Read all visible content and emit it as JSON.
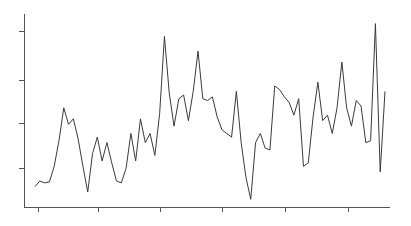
{
  "chart_data": {
    "type": "line",
    "title": "",
    "subtitle": "",
    "xlabel": "",
    "ylabel": "",
    "grid": false,
    "legend": false,
    "legend_position": "none",
    "line_color": "#3a3a3a",
    "axis_color": "#555555",
    "background_color": "#ffffff",
    "xlim": [
      0,
      80
    ],
    "ylim": [
      0,
      100
    ],
    "xticks": [
      4,
      17,
      30,
      44,
      57,
      70
    ],
    "xticklabels": [
      "",
      "",
      "",
      "",
      "",
      ""
    ],
    "yticks": [
      20,
      40,
      60,
      80
    ],
    "yticklabels": [
      "",
      "",
      "",
      ""
    ],
    "x": [
      0,
      1,
      2,
      3,
      4,
      5,
      6,
      7,
      8,
      9,
      10,
      11,
      12,
      13,
      14,
      15,
      16,
      17,
      18,
      19,
      20,
      21,
      22,
      23,
      24,
      25,
      26,
      27,
      28,
      29,
      30,
      31,
      32,
      33,
      34,
      35,
      36,
      37,
      38,
      39,
      40,
      41,
      42,
      43,
      44,
      45,
      46,
      47,
      48,
      49,
      50,
      51,
      52,
      53,
      54,
      55,
      56,
      57,
      58,
      59,
      60,
      61,
      62,
      63,
      64,
      65,
      66,
      67,
      68,
      69,
      70,
      71,
      72,
      73
    ],
    "values": [
      9,
      12,
      11,
      11.5,
      20,
      34,
      52,
      43,
      46,
      35,
      20,
      6,
      27,
      36,
      23,
      33,
      22,
      12,
      11,
      19,
      38,
      23,
      46,
      33,
      38,
      26,
      49,
      91,
      60,
      42,
      57,
      59,
      45,
      61,
      83,
      57,
      56,
      58,
      47,
      40,
      38,
      36,
      61,
      33,
      14,
      2,
      33,
      38,
      30,
      29,
      64,
      62,
      58,
      55,
      48,
      57,
      20,
      22,
      47,
      66,
      45,
      48,
      38,
      52,
      77,
      52,
      42,
      56,
      53,
      33,
      34,
      98,
      17,
      61
    ],
    "series": [
      {
        "name": "series-1",
        "values": [
          9,
          12,
          11,
          11.5,
          20,
          34,
          52,
          43,
          46,
          35,
          20,
          6,
          27,
          36,
          23,
          33,
          22,
          12,
          11,
          19,
          38,
          23,
          46,
          33,
          38,
          26,
          49,
          91,
          60,
          42,
          57,
          59,
          45,
          61,
          83,
          57,
          56,
          58,
          47,
          40,
          38,
          36,
          61,
          33,
          14,
          2,
          33,
          38,
          30,
          29,
          64,
          62,
          58,
          55,
          48,
          57,
          20,
          22,
          47,
          66,
          45,
          48,
          38,
          52,
          77,
          52,
          42,
          56,
          53,
          33,
          34,
          98,
          17,
          61
        ]
      }
    ],
    "annotations": []
  },
  "geometry": {
    "plot_left": 24,
    "plot_right": 390,
    "plot_top": 14,
    "plot_bottom": 207,
    "data_x_start": 35,
    "data_x_end": 385,
    "y_tick_px": [
      31,
      80,
      123,
      168
    ],
    "x_tick_px": [
      38,
      98,
      160,
      222,
      285,
      348
    ],
    "tick_len": 5
  }
}
